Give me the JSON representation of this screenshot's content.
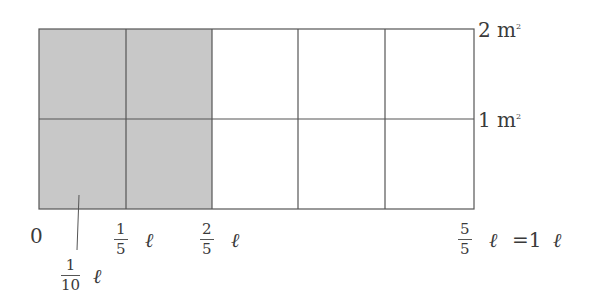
{
  "diagram": {
    "grid": {
      "columns": 5,
      "rows": 2,
      "shaded_columns": 2,
      "shade_color": "#c8c8c8",
      "line_color": "#555555"
    },
    "right_labels": [
      {
        "value": "2 m",
        "sup": "2"
      },
      {
        "value": "1 m",
        "sup": "2"
      }
    ],
    "bottom_labels": {
      "zero": "0",
      "one_fifth": {
        "num": "1",
        "den": "5",
        "unit": "ℓ"
      },
      "two_fifths": {
        "num": "2",
        "den": "5",
        "unit": "ℓ"
      },
      "five_fifths": {
        "num": "5",
        "den": "5",
        "unit": "ℓ",
        "equals": "=1",
        "unit2": "ℓ"
      },
      "one_tenth": {
        "num": "1",
        "den": "10",
        "unit": "ℓ"
      }
    }
  }
}
